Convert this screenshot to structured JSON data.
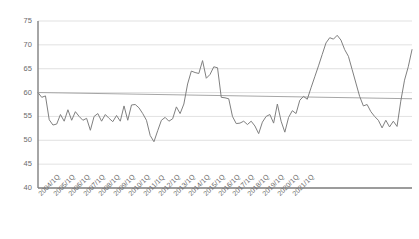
{
  "chart_data": {
    "type": "line",
    "title": "",
    "subtitle": "",
    "xlabel": "",
    "ylabel": "",
    "ylim": [
      40,
      75
    ],
    "ytick_values": [
      40,
      45,
      50,
      55,
      60,
      65,
      70,
      75
    ],
    "ytick_labels": [
      "40",
      "45",
      "50",
      "55",
      "60",
      "65",
      "70",
      "75"
    ],
    "grid": true,
    "grid_axis": "y",
    "legend": "none",
    "xtick_labels": [
      "2004/1Q",
      "2005/1Q",
      "2006/1Q",
      "2007/1Q",
      "2008/1Q",
      "2009/1Q",
      "2010/1Q",
      "2011/1Q",
      "2012/1Q",
      "2013/1Q",
      "2014/1Q",
      "2015/1Q",
      "2016/1Q",
      "2017/1Q",
      "2018/1Q",
      "2019/1Q",
      "2020/1Q",
      "2021/1Q"
    ],
    "xtick_interval_quarters": 4,
    "series": [
      {
        "name": "Index",
        "color": "#808080",
        "values": [
          60.0,
          59.0,
          59.3,
          54.3,
          53.2,
          53.4,
          55.4,
          54.0,
          56.4,
          54.2,
          56.0,
          55.0,
          54.2,
          54.6,
          52.1,
          55.0,
          55.6,
          54.0,
          55.4,
          54.6,
          53.9,
          55.2,
          54.0,
          57.2,
          54.2,
          57.4,
          57.5,
          56.8,
          55.6,
          54.2,
          51.0,
          49.7,
          52.0,
          54.2,
          54.8,
          54.0,
          54.5,
          57.0,
          55.6,
          57.6,
          61.8,
          64.5,
          64.2,
          64.0,
          66.7,
          63.0,
          63.8,
          65.4,
          65.2,
          59.0,
          58.9,
          58.7,
          55.0,
          53.5,
          53.6,
          54.0,
          53.3,
          54.0,
          53.0,
          51.4,
          53.8,
          55.0,
          55.4,
          53.6,
          57.6,
          54.0,
          51.7,
          54.8,
          56.2,
          55.6,
          58.4,
          59.2,
          58.6,
          61.0,
          63.3,
          65.6,
          68.0,
          70.4,
          71.5,
          71.2,
          72.0,
          71.0,
          69.0,
          67.6,
          64.8,
          62.0,
          59.2,
          57.2,
          57.5,
          56.0,
          55.0,
          54.2,
          52.6,
          54.2,
          52.8,
          54.0,
          52.9,
          58.2,
          62.6,
          65.4,
          69.0
        ]
      }
    ],
    "trendline": {
      "name": "Linear trend",
      "color": "#a6a6a6",
      "start_value": 60.0,
      "end_value": 58.7,
      "style": "solid"
    }
  },
  "axes": {
    "axis_color": "#808080",
    "grid_color": "#d9d9d9",
    "tick_label_color": "#6b6b6b"
  }
}
